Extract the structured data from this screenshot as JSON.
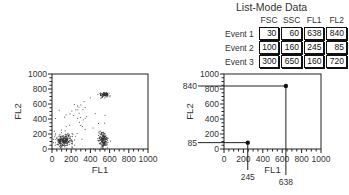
{
  "table": {
    "title": "List-Mode Data",
    "columns": [
      "FSC",
      "SSC",
      "FL1",
      "FL2"
    ],
    "rows": [
      {
        "label": "Event 1",
        "values": [
          30,
          60,
          638,
          840
        ]
      },
      {
        "label": "Event 2",
        "values": [
          100,
          160,
          245,
          85
        ]
      },
      {
        "label": "Event 3",
        "values": [
          300,
          650,
          160,
          720
        ]
      }
    ]
  },
  "chart_data": [
    {
      "type": "scatter",
      "title": "",
      "xlabel": "FL1",
      "ylabel": "FL2",
      "xlim": [
        0,
        1000
      ],
      "ylim": [
        0,
        1000
      ],
      "xticks": [
        0,
        200,
        400,
        600,
        800,
        1000
      ],
      "yticks": [
        0,
        200,
        400,
        600,
        800,
        1000
      ],
      "grid": false,
      "clusters": [
        {
          "name": "low FL1 / low FL2",
          "center": [
            120,
            120
          ],
          "spread": [
            80,
            70
          ],
          "count": 260
        },
        {
          "name": "high FL1 / low FL2",
          "center": [
            530,
            120
          ],
          "spread": [
            40,
            90
          ],
          "count": 200
        },
        {
          "name": "high FL1 / high FL2",
          "center": [
            540,
            730
          ],
          "spread": [
            45,
            30
          ],
          "count": 90
        },
        {
          "name": "scattered",
          "center": [
            300,
            450
          ],
          "spread": [
            180,
            200
          ],
          "count": 35
        }
      ]
    },
    {
      "type": "scatter",
      "title": "",
      "xlabel": "FL1",
      "ylabel": "FL2",
      "xlim": [
        0,
        1000
      ],
      "ylim": [
        0,
        1000
      ],
      "xticks": [
        0,
        200,
        400,
        600,
        800,
        1000
      ],
      "yticks": [
        0,
        200,
        400,
        600,
        800,
        1000
      ],
      "grid": false,
      "points": [
        {
          "event": "Event 1",
          "x": 638,
          "y": 840,
          "xlabel": "638",
          "ylabel": "840"
        },
        {
          "event": "Event 2",
          "x": 245,
          "y": 85,
          "xlabel": "245",
          "ylabel": "85"
        }
      ]
    }
  ]
}
